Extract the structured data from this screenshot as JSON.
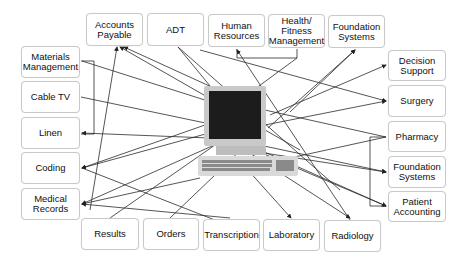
{
  "diagram": {
    "center": {
      "label": "Central computer",
      "icon": "computer-icon"
    },
    "top_nodes": [
      {
        "id": "accounts-payable",
        "label": "Accounts\nPayable"
      },
      {
        "id": "adt",
        "label": "ADT"
      },
      {
        "id": "human-resources",
        "label": "Human\nResources"
      },
      {
        "id": "health-fitness",
        "label": "Health/\nFitness\nManagement"
      },
      {
        "id": "foundation-systems-top",
        "label": "Foundation\nSystems"
      }
    ],
    "left_nodes": [
      {
        "id": "materials-management",
        "label": "Materials\nManagement"
      },
      {
        "id": "cable-tv",
        "label": "Cable TV"
      },
      {
        "id": "linen",
        "label": "Linen"
      },
      {
        "id": "coding",
        "label": "Coding"
      },
      {
        "id": "medical-records",
        "label": "Medical\nRecords"
      }
    ],
    "right_nodes": [
      {
        "id": "decision-support",
        "label": "Decision\nSupport"
      },
      {
        "id": "surgery",
        "label": "Surgery"
      },
      {
        "id": "pharmacy",
        "label": "Pharmacy"
      },
      {
        "id": "foundation-systems-right",
        "label": "Foundation\nSystems"
      },
      {
        "id": "patient-accounting",
        "label": "Patient\nAccounting"
      }
    ],
    "bottom_nodes": [
      {
        "id": "results",
        "label": "Results"
      },
      {
        "id": "orders",
        "label": "Orders"
      },
      {
        "id": "transcription",
        "label": "Transcription"
      },
      {
        "id": "laboratory",
        "label": "Laboratory"
      },
      {
        "id": "radiology",
        "label": "Radiology"
      }
    ],
    "colors": {
      "line": "#2a2a2a",
      "border": "#c9c9c9",
      "screen": "#1c1c1c",
      "case": "#d9d9d9"
    }
  }
}
